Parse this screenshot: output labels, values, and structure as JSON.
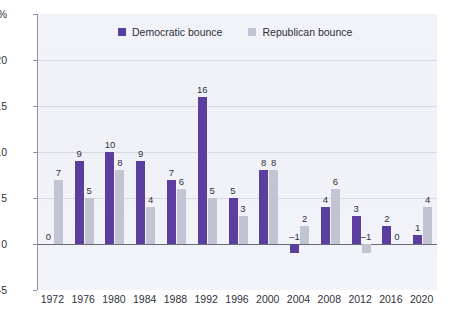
{
  "chart_data": {
    "type": "bar",
    "title": "",
    "subtitle": "",
    "xlabel": "",
    "ylabel": "",
    "ylim": [
      -5,
      25
    ],
    "yticks": [
      -5,
      0,
      5,
      10,
      15,
      20,
      25
    ],
    "ytick_labels": [
      "–5",
      "0",
      "5",
      "10",
      "15",
      "20",
      "25%"
    ],
    "grid": true,
    "gridlines_at": [
      5,
      10,
      15,
      20
    ],
    "legend_position": "top-center",
    "categories": [
      "1972",
      "1976",
      "1980",
      "1984",
      "1988",
      "1992",
      "1996",
      "2000",
      "2004",
      "2008",
      "2012",
      "2016",
      "2020"
    ],
    "series": [
      {
        "name": "Democratic bounce",
        "color": "#5b3f9e",
        "values": [
          0,
          9,
          10,
          9,
          7,
          16,
          5,
          8,
          -1,
          4,
          3,
          2,
          1
        ],
        "labels": [
          "0",
          "9",
          "10",
          "9",
          "7",
          "16",
          "5",
          "8",
          "–1",
          "4",
          "3",
          "2",
          "1"
        ]
      },
      {
        "name": "Republican bounce",
        "color": "#c2c3d3",
        "values": [
          7,
          5,
          8,
          4,
          6,
          5,
          3,
          8,
          2,
          6,
          -1,
          0,
          4
        ],
        "labels": [
          "7",
          "5",
          "8",
          "4",
          "6",
          "5",
          "3",
          "8",
          "2",
          "6",
          "–1",
          "0",
          "4"
        ]
      }
    ]
  },
  "legend": {
    "items": [
      {
        "label": "Democratic bounce",
        "color": "#5b3f9e",
        "swatch_name": "legend-swatch-democratic"
      },
      {
        "label": "Republican bounce",
        "color": "#c2c3d3",
        "swatch_name": "legend-swatch-republican"
      }
    ]
  },
  "colors": {
    "democratic": "#5b3f9e",
    "republican": "#c2c3d3",
    "plot_background": "#f1f3f8",
    "gridline": "#d8dae6",
    "axis": "#8f8fa3",
    "zero_line": "#6b6b80",
    "text": "#2f2f3c"
  }
}
